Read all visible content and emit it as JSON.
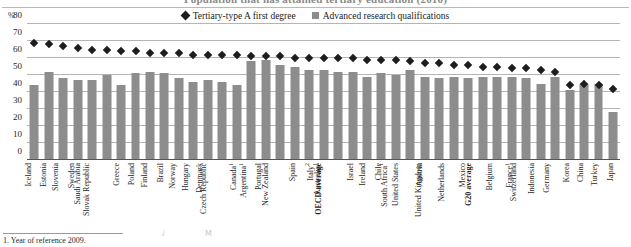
{
  "title": "Population that has attained tertiary education (2010)",
  "axis": {
    "unit_label": "%",
    "yticks": [
      0,
      10,
      20,
      30,
      40,
      50,
      60,
      70,
      80
    ]
  },
  "legend": [
    {
      "label": "Tertiary-type A first degree",
      "marker": "diamond",
      "color": "#1d1d1d"
    },
    {
      "label": "Advanced research qualifications",
      "marker": "square",
      "color": "#8c8c8c"
    }
  ],
  "footnote": "1. Year of reference 2009.",
  "chart_data": {
    "type": "bar",
    "title": "Population that has attained tertiary education (2010)",
    "xlabel": "",
    "ylabel": "%",
    "ylim": [
      0,
      80
    ],
    "grid": true,
    "legend_position": "top-center",
    "categories": [
      "Iceland",
      "Estonia",
      "Slovenia",
      "Sweden",
      "Saudi Arabia",
      "Slovak Republic",
      "Greece",
      "Poland",
      "Finland",
      "Brazil",
      "Norway",
      "Hungary",
      "Denmark",
      "Czech Republic",
      "Canada¹",
      "Argentina¹",
      "Portugal",
      "New Zealand",
      "Spain",
      "Italy²",
      "Australia¹",
      "OECD average",
      "Israel",
      "Ireland",
      "Chile",
      "South Africa¹",
      "United States",
      "Austria",
      "United Kingdom",
      "Netherlands",
      "Mexico",
      "G20 average",
      "Belgium",
      "France¹",
      "Switzerland",
      "Indonesia",
      "Germany",
      "Korea",
      "China",
      "Turkey",
      "Japan"
    ],
    "bold_categories": [
      "OECD average",
      "G20 average"
    ],
    "series": [
      {
        "name": "Tertiary-type A first degree",
        "marker": "diamond",
        "color": "#1d1d1d",
        "values": [
          69,
          68,
          67,
          66,
          65,
          65,
          64,
          64,
          63,
          63,
          63,
          62,
          62,
          62,
          62,
          61,
          61,
          61,
          60,
          60,
          60,
          60,
          60,
          59,
          59,
          59,
          58,
          57,
          57,
          56,
          56,
          55,
          55,
          54,
          54,
          53,
          52,
          44,
          45,
          44,
          42
        ]
      },
      {
        "name": "Advanced research qualifications",
        "marker": "bar",
        "color": "#8d8d8d",
        "values": [
          44,
          52,
          48,
          47,
          47,
          50,
          44,
          51,
          52,
          51,
          48,
          46,
          47,
          46,
          44,
          58,
          59,
          56,
          55,
          53,
          53,
          52,
          52,
          49,
          51,
          50,
          53,
          49,
          48,
          49,
          48,
          49,
          49,
          49,
          48,
          45,
          49,
          41,
          45,
          45,
          28
        ]
      }
    ]
  }
}
